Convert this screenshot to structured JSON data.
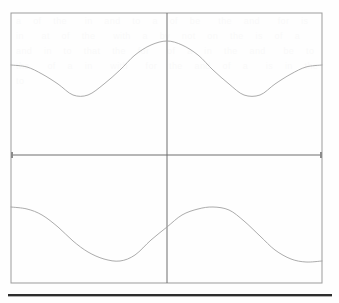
{
  "figure": {
    "kind": "sinusoid-plot",
    "background_color": "#fefefe",
    "frame_color": "#9b9b9b",
    "axis_color": "#6e6e6e",
    "curve_color": "#a2a2a2",
    "rule_color": "#2d2d2d",
    "ghost_text": "a  of  the   in  and  to  a  of  be   the  and   for  is  in   at  of  the   with  a  by  not  on  the  is  of  a  and  in  to  that  the  for   of  a  in  the  and   be  to  the   of  a  in   with   for  the  and  of  a   is  in  the  to"
  },
  "plot_area": {
    "left": 11,
    "top": 13,
    "right": 322,
    "bottom": 283,
    "width": 311,
    "height": 270,
    "center_x": 167,
    "center_y": 155
  },
  "axes": {
    "vertical_axis_label": "",
    "horizontal_axis_label": "",
    "tick_marks": [
      {
        "name": "left-axis-tick",
        "x": 12,
        "y": 155
      },
      {
        "name": "right-axis-tick",
        "x": 321,
        "y": 155
      }
    ],
    "tick_labels": []
  },
  "chart_data": {
    "type": "line",
    "title": "",
    "subtitle": "",
    "xlabel": "",
    "ylabel": "",
    "grid": false,
    "legend_position": "none",
    "xlim": [
      -1,
      1
    ],
    "ylim": [
      -1,
      1
    ],
    "x_axis_crossing": 0,
    "y_axis_crossing": 0,
    "annotations": [],
    "tick_labels": {
      "x": [],
      "y": []
    },
    "series": [
      {
        "name": "upper-curve",
        "description": "cosine-like wave in the upper half, peak at x = 0",
        "color": "#a2a2a2",
        "amplitude": 0.2,
        "offset": 0.615,
        "period_in_x_units": 2.0,
        "phase": "cosine",
        "x": [
          -1.0,
          -0.9,
          -0.8,
          -0.7,
          -0.6,
          -0.5,
          -0.4,
          -0.3,
          -0.2,
          -0.1,
          0.0,
          0.1,
          0.2,
          0.3,
          0.4,
          0.5,
          0.6,
          0.7,
          0.8,
          0.9,
          1.0
        ],
        "y": [
          0.415,
          0.425,
          0.454,
          0.5,
          0.558,
          0.615,
          0.672,
          0.73,
          0.776,
          0.805,
          0.815,
          0.805,
          0.776,
          0.73,
          0.672,
          0.615,
          0.558,
          0.5,
          0.454,
          0.425,
          0.415
        ],
        "pixel_points": [
          [
            11,
            65
          ],
          [
            27,
            67
          ],
          [
            42,
            74
          ],
          [
            58,
            84
          ],
          [
            73,
            95
          ],
          [
            88,
            95
          ],
          [
            104,
            84
          ],
          [
            120,
            70
          ],
          [
            135,
            55
          ],
          [
            151,
            45
          ],
          [
            167,
            41
          ],
          [
            182,
            45
          ],
          [
            198,
            55
          ],
          [
            213,
            70
          ],
          [
            229,
            84
          ],
          [
            244,
            95
          ],
          [
            260,
            95
          ],
          [
            275,
            84
          ],
          [
            291,
            74
          ],
          [
            306,
            67
          ],
          [
            322,
            65
          ]
        ],
        "pixel_peak": {
          "x": 167,
          "y": 41
        },
        "pixel_minima": [
          {
            "x": 80,
            "y": 96
          },
          {
            "x": 254,
            "y": 96
          }
        ]
      },
      {
        "name": "lower-curve",
        "description": "phase-shifted sine-like wave in the lower half, trough left of center, crest right of center",
        "color": "#a2a2a2",
        "amplitude": 0.2,
        "offset": -0.395,
        "period_in_x_units": 2.0,
        "phase": "shifted-sine",
        "x": [
          -1.0,
          -0.9,
          -0.8,
          -0.7,
          -0.6,
          -0.5,
          -0.4,
          -0.3,
          -0.2,
          -0.1,
          0.0,
          0.1,
          0.2,
          0.3,
          0.4,
          0.5,
          0.6,
          0.7,
          0.8,
          0.9,
          1.0
        ],
        "y": [
          -0.385,
          -0.392,
          -0.42,
          -0.47,
          -0.53,
          -0.588,
          -0.606,
          -0.585,
          -0.53,
          -0.455,
          -0.395,
          -0.34,
          -0.305,
          -0.3,
          -0.33,
          -0.395,
          -0.47,
          -0.545,
          -0.592,
          -0.606,
          -0.592
        ],
        "pixel_points": [
          [
            11,
            207
          ],
          [
            27,
            209
          ],
          [
            42,
            215
          ],
          [
            58,
            227
          ],
          [
            73,
            241
          ],
          [
            88,
            252
          ],
          [
            104,
            259
          ],
          [
            120,
            261
          ],
          [
            135,
            255
          ],
          [
            151,
            240
          ],
          [
            167,
            227
          ],
          [
            182,
            215
          ],
          [
            198,
            209
          ],
          [
            213,
            207
          ],
          [
            229,
            210
          ],
          [
            244,
            221
          ],
          [
            260,
            236
          ],
          [
            275,
            250
          ],
          [
            291,
            259
          ],
          [
            306,
            262
          ],
          [
            322,
            261
          ]
        ],
        "pixel_peak": {
          "x": 216,
          "y": 207
        },
        "pixel_minima": [
          {
            "x": 117,
            "y": 262
          },
          {
            "x": 312,
            "y": 262
          }
        ]
      }
    ]
  }
}
